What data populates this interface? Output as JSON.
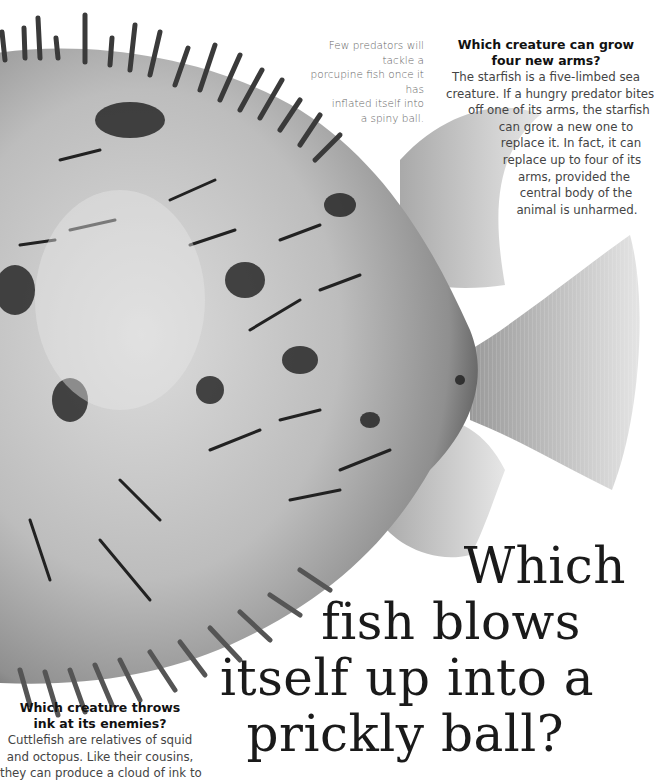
{
  "caption": {
    "lines": [
      "Few predators will tackle a",
      "porcupine fish once it has",
      "inflated itself into",
      "a spiny ball."
    ]
  },
  "starfish_qa": {
    "title_lines": [
      "Which creature can grow",
      "four new arms?"
    ],
    "body_lines": [
      "The starfish is a five-limbed sea",
      "creature. If a hungry predator bites",
      "off one of its arms, the starfish",
      "can grow a new one to",
      "replace it. In fact, it can",
      "replace up to four of its",
      "arms, provided the",
      "central body of the",
      "animal is unharmed."
    ]
  },
  "headline": {
    "lines": [
      "Which",
      "fish blows",
      "itself up into a",
      "prickly ball?"
    ]
  },
  "cuttlefish_qa": {
    "title_lines": [
      "Which creature throws",
      "ink at its enemies?"
    ],
    "body_lines": [
      "Cuttlefish are relatives of squid",
      "and octopus. Like their cousins,",
      "they can produce a cloud of ink to"
    ]
  },
  "illustration": {
    "subject": "porcupine fish inflated with spines",
    "palette": {
      "dark": "#1a1a1a",
      "mid": "#8a8a8a",
      "light": "#d8d8d8",
      "background": "#ffffff"
    }
  }
}
